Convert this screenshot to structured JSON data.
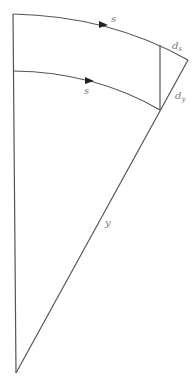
{
  "diagram": {
    "type": "geometric-sector",
    "colors": {
      "stroke": "#555555",
      "label": "#777777",
      "background": "#ffffff"
    },
    "labels": {
      "outer_arc": "s",
      "inner_arc": "s",
      "ds_main": "d",
      "ds_sub": "s",
      "dy_main": "d",
      "dy_sub": "y",
      "radius": "y"
    }
  }
}
